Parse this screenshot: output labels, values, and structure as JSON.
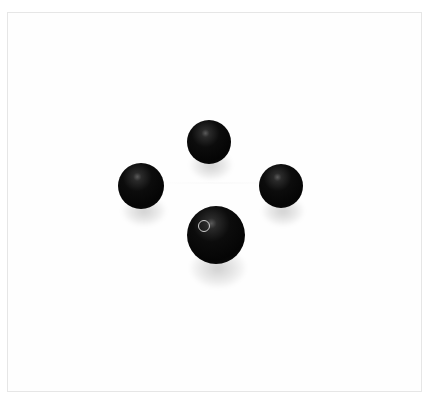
{
  "image": {
    "subject": "four black round beads on white background",
    "background_color": "#ffffff",
    "bead_color": "#0a0a0a",
    "beads": [
      {
        "position": "top",
        "cx": 209,
        "cy": 142,
        "r": 22
      },
      {
        "position": "left",
        "cx": 141,
        "cy": 186,
        "r": 23
      },
      {
        "position": "right",
        "cx": 281,
        "cy": 186,
        "r": 22
      },
      {
        "position": "bottom",
        "cx": 216,
        "cy": 235,
        "r": 29
      }
    ]
  }
}
